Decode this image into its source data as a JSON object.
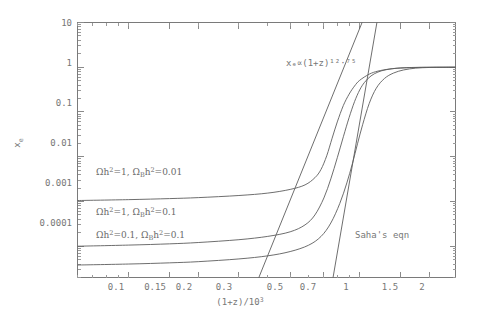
{
  "figure": {
    "title": "",
    "background": "#ffffff",
    "ink_color": "#6b6b6b"
  },
  "chart_data": {
    "type": "line",
    "title": "",
    "subtitle": "",
    "xlabel": "(1+z)/10^3",
    "ylabel": "x_e",
    "xscale": "log",
    "yscale": "log",
    "xlim": [
      0.06,
      2.6
    ],
    "ylim": [
      2e-05,
      10
    ],
    "grid": false,
    "legend": "inline-labels",
    "xticks": [
      0.1,
      0.15,
      0.2,
      0.3,
      0.5,
      0.7,
      1,
      1.5,
      2
    ],
    "xtick_labels": [
      "0.1",
      "0.15",
      "0.2",
      "0.3",
      "0.5",
      "0.7",
      "1",
      "1.5",
      "2"
    ],
    "yticks": [
      0.0001,
      0.001,
      0.01,
      0.1,
      1,
      10
    ],
    "ytick_labels": [
      "0.0001",
      "0.001",
      "0.01",
      "0.1",
      "1",
      "10"
    ],
    "series": [
      {
        "name": "Omega h^2=1, Omega_B h^2=0.01",
        "label": "Ωh²=1, Ωʙh²=0.01",
        "freeze_out": 0.0011,
        "transition_x": 0.72,
        "x": [
          0.06,
          0.1,
          0.15,
          0.2,
          0.3,
          0.4,
          0.5,
          0.58,
          0.64,
          0.68,
          0.72,
          0.76,
          0.8,
          0.85,
          0.9,
          0.95,
          1.0,
          1.1,
          1.2,
          1.35,
          1.5,
          1.8,
          2.1,
          2.6
        ],
        "y": [
          0.00105,
          0.0011,
          0.00116,
          0.00122,
          0.00136,
          0.00154,
          0.00186,
          0.00235,
          0.0034,
          0.0052,
          0.0105,
          0.026,
          0.06,
          0.14,
          0.25,
          0.38,
          0.51,
          0.7,
          0.82,
          0.915,
          0.96,
          0.99,
          0.998,
          1.0
        ]
      },
      {
        "name": "Omega h^2=1, Omega_B h^2=0.1",
        "label": "Ωh²=1, Ωʙh²=0.1",
        "freeze_out": 0.000105,
        "transition_x": 0.86,
        "x": [
          0.06,
          0.1,
          0.15,
          0.2,
          0.3,
          0.4,
          0.5,
          0.58,
          0.64,
          0.7,
          0.75,
          0.8,
          0.85,
          0.9,
          0.95,
          1.0,
          1.05,
          1.12,
          1.2,
          1.3,
          1.45,
          1.65,
          1.95,
          2.6
        ],
        "y": [
          0.0001,
          0.000106,
          0.000113,
          0.000121,
          0.00014,
          0.000166,
          0.00021,
          0.0003,
          0.0005,
          0.0012,
          0.0032,
          0.0095,
          0.028,
          0.075,
          0.17,
          0.31,
          0.46,
          0.64,
          0.78,
          0.88,
          0.95,
          0.985,
          0.997,
          1.0
        ]
      },
      {
        "name": "Omega h^2=0.1, Omega_B h^2=0.1",
        "label": "Ωh²=0.1, Ωʙh²=0.1",
        "freeze_out": 3.95e-05,
        "transition_x": 0.96,
        "x": [
          0.06,
          0.1,
          0.15,
          0.2,
          0.3,
          0.4,
          0.5,
          0.6,
          0.68,
          0.75,
          0.82,
          0.88,
          0.93,
          0.98,
          1.03,
          1.1,
          1.18,
          1.28,
          1.4,
          1.55,
          1.75,
          2.0,
          2.3,
          2.6
        ],
        "y": [
          3.8e-05,
          4e-05,
          4.25e-05,
          4.52e-05,
          5.2e-05,
          6.1e-05,
          7.6e-05,
          0.000105,
          0.000165,
          0.00033,
          0.0009,
          0.0026,
          0.007,
          0.02,
          0.052,
          0.155,
          0.34,
          0.56,
          0.74,
          0.87,
          0.955,
          0.988,
          0.997,
          1.0
        ]
      }
    ],
    "reference_lines": [
      {
        "name": "power-law-asymptote",
        "label": "xₑ∝(1+z)¹²·⁷⁵",
        "label_plain": "x_e ∝ (1+z)^12.75",
        "exponent": 12.75,
        "kind": "power-law",
        "x_at_y1": 0.855,
        "slope_decades_per_decade": 12.75
      },
      {
        "name": "saha-equation",
        "label": "Saha's eqn",
        "kind": "saha",
        "x_at_y1": 1.1,
        "slope_decades_per_decade": 30.0
      }
    ],
    "annotations": [
      {
        "name": "power-law-annotation",
        "text": "xₑ∝(1+z)¹²·⁷⁵",
        "x_px": 286,
        "y_px": 63
      },
      {
        "name": "saha-annotation",
        "text": "Saha's eqn",
        "x_px": 355,
        "y_px": 235
      }
    ]
  },
  "axes": {
    "x_axis_title": "(1+z)/10",
    "x_axis_title_exponent": "3",
    "y_axis_title": "x",
    "y_axis_title_subscript": "e"
  },
  "curve_labels": [
    {
      "text_a": "Ωh",
      "sup_a": "2",
      "text_b": "=1, ",
      "text_c": "Ω",
      "sub_c": "B",
      "text_d": "h",
      "sup_d": "2",
      "text_e": "=0.01",
      "full": "Ωh²=1, Ωʙh²=0.01"
    },
    {
      "text_a": "Ωh",
      "sup_a": "2",
      "text_b": "=1, ",
      "text_c": "Ω",
      "sub_c": "B",
      "text_d": "h",
      "sup_d": "2",
      "text_e": "=0.1",
      "full": "Ωh²=1, Ωʙh²=0.1"
    },
    {
      "text_a": "Ωh",
      "sup_a": "2",
      "text_b": "=0.1, ",
      "text_c": "Ω",
      "sub_c": "B",
      "text_d": "h",
      "sup_d": "2",
      "text_e": "=0.1",
      "full": "Ωh²=0.1, Ωʙh²=0.1"
    }
  ],
  "ticklabels": {
    "y": [
      "10",
      "1",
      "0.1",
      "0.01",
      "0.001",
      "0.0001"
    ],
    "x": [
      "0.1",
      "0.15",
      "0.2",
      "0.3",
      "0.5",
      "0.7",
      "1",
      "1.5",
      "2"
    ]
  }
}
